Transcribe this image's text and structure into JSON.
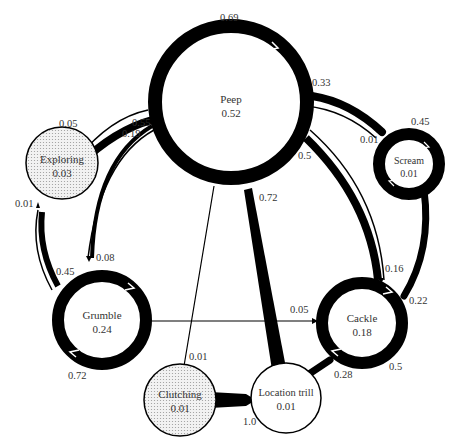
{
  "diagram": {
    "type": "state-transition",
    "nodes": [
      {
        "id": "peep",
        "name": "Peep",
        "value": "0.52",
        "self_loop": "0.69",
        "fill": "#ffffff"
      },
      {
        "id": "exploring",
        "name": "Exploring",
        "value": "0.03",
        "fill": "#e8e8e8"
      },
      {
        "id": "scream",
        "name": "Scream",
        "value": "0.01",
        "self_loop": "0.45",
        "fill": "#ffffff"
      },
      {
        "id": "grumble",
        "name": "Grumble",
        "value": "0.24",
        "self_loop": "0.72",
        "fill": "#ffffff"
      },
      {
        "id": "cackle",
        "name": "Cackle",
        "value": "0.18",
        "self_loop": "0.5",
        "fill": "#ffffff"
      },
      {
        "id": "clutching",
        "name": "Clutching",
        "value": "0.01",
        "fill": "#e8e8e8"
      },
      {
        "id": "location_trill",
        "name": "Location trill",
        "value": "0.01",
        "fill": "#ffffff"
      }
    ],
    "edges": [
      {
        "from": "peep",
        "to": "peep",
        "label": "0.69"
      },
      {
        "from": "exploring",
        "to": "peep",
        "label": "0.55"
      },
      {
        "from": "peep",
        "to": "exploring",
        "label": "0.05"
      },
      {
        "from": "peep",
        "to": "grumble",
        "label": "0.08"
      },
      {
        "from": "grumble",
        "to": "peep",
        "label": "0.19"
      },
      {
        "from": "exploring",
        "to": "grumble",
        "label": "0.45"
      },
      {
        "from": "grumble",
        "to": "exploring",
        "label": "0.01"
      },
      {
        "from": "scream",
        "to": "peep",
        "label": "0.33"
      },
      {
        "from": "peep",
        "to": "scream",
        "label": "0.01"
      },
      {
        "from": "scream",
        "to": "scream",
        "label": "0.45"
      },
      {
        "from": "cackle",
        "to": "peep",
        "label": "0.5"
      },
      {
        "from": "peep",
        "to": "cackle",
        "label": "0.16"
      },
      {
        "from": "scream",
        "to": "cackle",
        "label": "0.22"
      },
      {
        "from": "location_trill",
        "to": "peep",
        "label": "0.72"
      },
      {
        "from": "grumble",
        "to": "grumble",
        "label": "0.72"
      },
      {
        "from": "grumble",
        "to": "cackle",
        "label": "0.05"
      },
      {
        "from": "cackle",
        "to": "cackle",
        "label": "0.5"
      },
      {
        "from": "peep",
        "to": "clutching",
        "label": "0.01"
      },
      {
        "from": "clutching",
        "to": "location_trill",
        "label": "1.0"
      },
      {
        "from": "location_trill",
        "to": "cackle",
        "label": "0.28"
      }
    ]
  },
  "labels": {
    "peep": {
      "name": "Peep",
      "value": "0.52",
      "self": "0.69"
    },
    "exploring": {
      "name": "Exploring",
      "value": "0.03"
    },
    "scream": {
      "name": "Scream",
      "value": "0.01",
      "self": "0.45"
    },
    "grumble": {
      "name": "Grumble",
      "value": "0.24",
      "self": "0.72"
    },
    "cackle": {
      "name": "Cackle",
      "value": "0.18",
      "self": "0.5"
    },
    "clutching": {
      "name": "Clutching",
      "value": "0.01"
    },
    "location_trill": {
      "name": "Location trill",
      "value": "0.01"
    },
    "edges": {
      "exploring_to_peep": "0.55",
      "peep_to_exploring": "0.05",
      "grumble_to_peep": "0.19",
      "peep_to_grumble": "0.08",
      "exploring_to_grumble": "0.45",
      "grumble_to_exploring": "0.01",
      "scream_to_peep": "0.33",
      "peep_to_scream": "0.01",
      "cackle_to_peep": "0.5",
      "peep_to_cackle": "0.16",
      "scream_to_cackle": "0.22",
      "trill_to_peep": "0.72",
      "grumble_to_cackle": "0.05",
      "peep_to_clutching": "0.01",
      "clutching_to_trill": "1.0",
      "trill_to_cackle": "0.28"
    }
  },
  "colors": {
    "stroke": "#000000",
    "text": "#333333",
    "node_fill": "#ffffff",
    "shaded_fill": "#e8e8e8"
  }
}
